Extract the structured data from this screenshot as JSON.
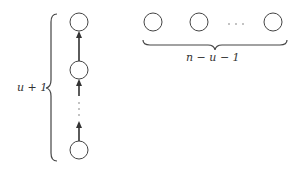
{
  "diagram": {
    "left_column": {
      "label": "u + 1",
      "node_count_visible": 3,
      "ellipsis": "⋮"
    },
    "right_row": {
      "label": "n − u − 1",
      "node_count_visible": 3,
      "ellipsis": "· · ·"
    },
    "colors": {
      "stroke": "#444444",
      "background": "#ffffff"
    }
  }
}
